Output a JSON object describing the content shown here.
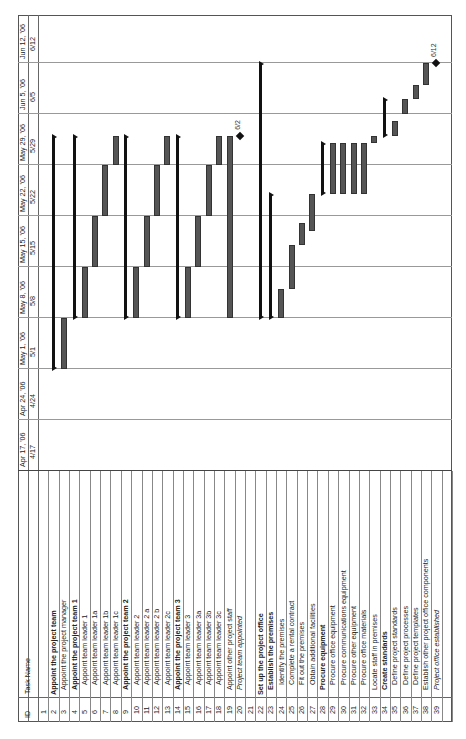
{
  "header": {
    "id_label": "ID",
    "task_name_label": "Task Name"
  },
  "timeline": {
    "weeks": [
      {
        "week": "Apr 17, '06",
        "day": "4/17"
      },
      {
        "week": "Apr 24, '06",
        "day": "4/24"
      },
      {
        "week": "May 1, '06",
        "day": "5/1"
      },
      {
        "week": "May 8, '06",
        "day": "5/8"
      },
      {
        "week": "May 15, '06",
        "day": "5/15"
      },
      {
        "week": "May 22, '06",
        "day": "5/22"
      },
      {
        "week": "May 29, '06",
        "day": "5/29"
      },
      {
        "week": "Jun 5, '06",
        "day": "6/5"
      },
      {
        "week": "Jun 12, '06",
        "day": "6/12"
      }
    ]
  },
  "tasks": [
    {
      "id": "1",
      "name": "",
      "style": "normal"
    },
    {
      "id": "2",
      "name": "Appoint the project team",
      "style": "bold"
    },
    {
      "id": "3",
      "name": "Appoint the project manager",
      "style": "normal",
      "indent": 1
    },
    {
      "id": "4",
      "name": "Appoint the project team 1",
      "style": "bold",
      "indent": 1
    },
    {
      "id": "5",
      "name": "Appoint team leader 1",
      "style": "normal",
      "indent": 2
    },
    {
      "id": "6",
      "name": "Appoint team leader 1a",
      "style": "normal",
      "indent": 2
    },
    {
      "id": "7",
      "name": "Appoint team leader 1b",
      "style": "normal",
      "indent": 2
    },
    {
      "id": "8",
      "name": "Appoint team leader 1c",
      "style": "normal",
      "indent": 2
    },
    {
      "id": "9",
      "name": "Appoint the project team 2",
      "style": "bold",
      "indent": 1
    },
    {
      "id": "10",
      "name": "Appoint team leader 2",
      "style": "normal",
      "indent": 2
    },
    {
      "id": "11",
      "name": "Appoint team leader 2 a",
      "style": "normal",
      "indent": 2
    },
    {
      "id": "12",
      "name": "Appoint team leader 2 b",
      "style": "normal",
      "indent": 2
    },
    {
      "id": "13",
      "name": "Appoint team leader 2c",
      "style": "normal",
      "indent": 2
    },
    {
      "id": "14",
      "name": "Appoint the project team 3",
      "style": "bold",
      "indent": 1
    },
    {
      "id": "15",
      "name": "Appoint team leader 3",
      "style": "normal",
      "indent": 2
    },
    {
      "id": "16",
      "name": "Appoint team leader 3a",
      "style": "normal",
      "indent": 2
    },
    {
      "id": "17",
      "name": "Appoint team leader 3b",
      "style": "normal",
      "indent": 2
    },
    {
      "id": "18",
      "name": "Appoint team leader 3c",
      "style": "normal",
      "indent": 2
    },
    {
      "id": "19",
      "name": "Appoint other project staff",
      "style": "normal",
      "indent": 1
    },
    {
      "id": "20",
      "name": "Project team appointed",
      "style": "italic",
      "indent": 1
    },
    {
      "id": "21",
      "name": "",
      "style": "normal"
    },
    {
      "id": "22",
      "name": "Set up the project office",
      "style": "bold"
    },
    {
      "id": "23",
      "name": "Establish the premises",
      "style": "bold",
      "indent": 1
    },
    {
      "id": "24",
      "name": "Identify the premises",
      "style": "normal",
      "indent": 2
    },
    {
      "id": "25",
      "name": "Complete a rental contract",
      "style": "normal",
      "indent": 2
    },
    {
      "id": "26",
      "name": "Fit out the premises",
      "style": "normal",
      "indent": 2
    },
    {
      "id": "27",
      "name": "Obtain additional facilities",
      "style": "normal",
      "indent": 2
    },
    {
      "id": "28",
      "name": "Procure equipment",
      "style": "bold",
      "indent": 1
    },
    {
      "id": "29",
      "name": "Procure office equipment",
      "style": "normal",
      "indent": 2
    },
    {
      "id": "30",
      "name": "Procure communications equipment",
      "style": "normal",
      "indent": 2
    },
    {
      "id": "31",
      "name": "Procure other equipment",
      "style": "normal",
      "indent": 2
    },
    {
      "id": "32",
      "name": "Procure office materials",
      "style": "normal",
      "indent": 2
    },
    {
      "id": "33",
      "name": "Locate staff in premises",
      "style": "normal",
      "indent": 1
    },
    {
      "id": "34",
      "name": "Create standards",
      "style": "bold",
      "indent": 1
    },
    {
      "id": "35",
      "name": "Define project standards",
      "style": "normal",
      "indent": 2
    },
    {
      "id": "36",
      "name": "Define project processes",
      "style": "normal",
      "indent": 2
    },
    {
      "id": "37",
      "name": "Define project templates",
      "style": "normal",
      "indent": 2
    },
    {
      "id": "38",
      "name": "Establish other project office components",
      "style": "normal",
      "indent": 1
    },
    {
      "id": "39",
      "name": "Project office established",
      "style": "italic",
      "indent": 1
    }
  ],
  "milestones": [
    {
      "row": 20,
      "label": "6/2"
    },
    {
      "row": 39,
      "label": "6/12"
    }
  ],
  "chart_data": {
    "type": "gantt",
    "title": "",
    "orientation": "rotated 90 degrees counter-clockwise",
    "axis": {
      "weeks": [
        "Apr 17, '06",
        "Apr 24, '06",
        "May 1, '06",
        "May 8, '06",
        "May 15, '06",
        "May 22, '06",
        "May 29, '06",
        "Jun 5, '06",
        "Jun 12, '06"
      ],
      "days": [
        "4/17",
        "4/24",
        "5/1",
        "5/8",
        "5/15",
        "5/22",
        "5/29",
        "6/5",
        "6/12"
      ]
    },
    "bars": [
      {
        "id": 2,
        "task": "Appoint the project team",
        "type": "summary",
        "start": "2006-05-01",
        "end": "2006-06-02"
      },
      {
        "id": 3,
        "task": "Appoint the project manager",
        "type": "task",
        "start": "2006-05-01",
        "end": "2006-05-08"
      },
      {
        "id": 4,
        "task": "Appoint the project team 1",
        "type": "summary",
        "start": "2006-05-08",
        "end": "2006-06-02"
      },
      {
        "id": 5,
        "task": "Appoint team leader 1",
        "type": "task",
        "start": "2006-05-08",
        "end": "2006-05-15"
      },
      {
        "id": 6,
        "task": "Appoint team leader 1a",
        "type": "task",
        "start": "2006-05-15",
        "end": "2006-05-22"
      },
      {
        "id": 7,
        "task": "Appoint team leader 1b",
        "type": "task",
        "start": "2006-05-22",
        "end": "2006-05-29"
      },
      {
        "id": 8,
        "task": "Appoint team leader 1c",
        "type": "task",
        "start": "2006-05-29",
        "end": "2006-06-02"
      },
      {
        "id": 9,
        "task": "Appoint the project team 2",
        "type": "summary",
        "start": "2006-05-08",
        "end": "2006-06-02"
      },
      {
        "id": 10,
        "task": "Appoint team leader 2",
        "type": "task",
        "start": "2006-05-08",
        "end": "2006-05-15"
      },
      {
        "id": 11,
        "task": "Appoint team leader 2 a",
        "type": "task",
        "start": "2006-05-15",
        "end": "2006-05-22"
      },
      {
        "id": 12,
        "task": "Appoint team leader 2 b",
        "type": "task",
        "start": "2006-05-22",
        "end": "2006-05-29"
      },
      {
        "id": 13,
        "task": "Appoint team leader 2c",
        "type": "task",
        "start": "2006-05-29",
        "end": "2006-06-02"
      },
      {
        "id": 14,
        "task": "Appoint the project team 3",
        "type": "summary",
        "start": "2006-05-08",
        "end": "2006-06-02"
      },
      {
        "id": 15,
        "task": "Appoint team leader 3",
        "type": "task",
        "start": "2006-05-08",
        "end": "2006-05-15"
      },
      {
        "id": 16,
        "task": "Appoint team leader 3a",
        "type": "task",
        "start": "2006-05-15",
        "end": "2006-05-22"
      },
      {
        "id": 17,
        "task": "Appoint team leader 3b",
        "type": "task",
        "start": "2006-05-22",
        "end": "2006-05-29"
      },
      {
        "id": 18,
        "task": "Appoint team leader 3c",
        "type": "task",
        "start": "2006-05-29",
        "end": "2006-06-02"
      },
      {
        "id": 19,
        "task": "Appoint other project staff",
        "type": "task",
        "start": "2006-05-08",
        "end": "2006-06-02"
      },
      {
        "id": 20,
        "task": "Project team appointed",
        "type": "milestone",
        "date": "2006-06-02",
        "label": "6/2"
      },
      {
        "id": 22,
        "task": "Set up the project office",
        "type": "summary",
        "start": "2006-05-08",
        "end": "2006-06-12"
      },
      {
        "id": 23,
        "task": "Establish the premises",
        "type": "summary",
        "start": "2006-05-08",
        "end": "2006-05-25"
      },
      {
        "id": 24,
        "task": "Identify the premises",
        "type": "task",
        "start": "2006-05-08",
        "end": "2006-05-12"
      },
      {
        "id": 25,
        "task": "Complete a rental contract",
        "type": "task",
        "start": "2006-05-12",
        "end": "2006-05-18"
      },
      {
        "id": 26,
        "task": "Fit out the premises",
        "type": "task",
        "start": "2006-05-18",
        "end": "2006-05-21"
      },
      {
        "id": 27,
        "task": "Obtain additional facilities",
        "type": "task",
        "start": "2006-05-20",
        "end": "2006-05-25"
      },
      {
        "id": 28,
        "task": "Procure equipment",
        "type": "summary",
        "start": "2006-05-25",
        "end": "2006-06-01"
      },
      {
        "id": 29,
        "task": "Procure office equipment",
        "type": "task",
        "start": "2006-05-25",
        "end": "2006-06-01"
      },
      {
        "id": 30,
        "task": "Procure communications equipment",
        "type": "task",
        "start": "2006-05-25",
        "end": "2006-06-01"
      },
      {
        "id": 31,
        "task": "Procure other equipment",
        "type": "task",
        "start": "2006-05-25",
        "end": "2006-06-01"
      },
      {
        "id": 32,
        "task": "Procure office materials",
        "type": "task",
        "start": "2006-05-25",
        "end": "2006-06-01"
      },
      {
        "id": 33,
        "task": "Locate staff in premises",
        "type": "task",
        "start": "2006-06-01",
        "end": "2006-06-02"
      },
      {
        "id": 34,
        "task": "Create standards",
        "type": "summary",
        "start": "2006-06-02",
        "end": "2006-06-07"
      },
      {
        "id": 35,
        "task": "Define project standards",
        "type": "task",
        "start": "2006-06-02",
        "end": "2006-06-04"
      },
      {
        "id": 36,
        "task": "Define project processes",
        "type": "task",
        "start": "2006-06-05",
        "end": "2006-06-07"
      },
      {
        "id": 37,
        "task": "Define project templates",
        "type": "task",
        "start": "2006-06-07",
        "end": "2006-06-09"
      },
      {
        "id": 38,
        "task": "Establish other project office components",
        "type": "task",
        "start": "2006-06-09",
        "end": "2006-06-12"
      },
      {
        "id": 39,
        "task": "Project office established",
        "type": "milestone",
        "date": "2006-06-12",
        "label": "6/12"
      }
    ]
  }
}
